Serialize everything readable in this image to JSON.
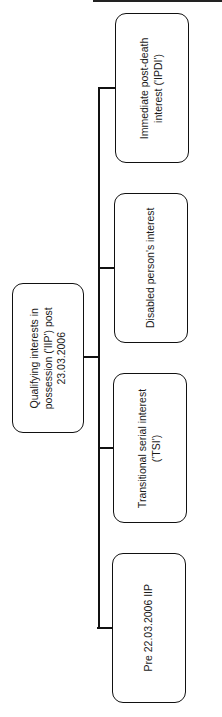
{
  "diagram": {
    "type": "hierarchy",
    "orientation": "rotated-90-ccw",
    "root": {
      "label": "Qualifying interests in\npossession ('IIP') post\n23.03.2006"
    },
    "children": [
      {
        "label": "Immediate post-death\ninterest ('IPDI')"
      },
      {
        "label": "Disabled person's interest"
      },
      {
        "label": "Transitional serial interest\n('TSI')"
      },
      {
        "label": "Pre 22.03.2006 IIP"
      }
    ],
    "colors": {
      "stroke": "#111111",
      "fill": "#ffffff",
      "text": "#1a1a1a"
    }
  }
}
